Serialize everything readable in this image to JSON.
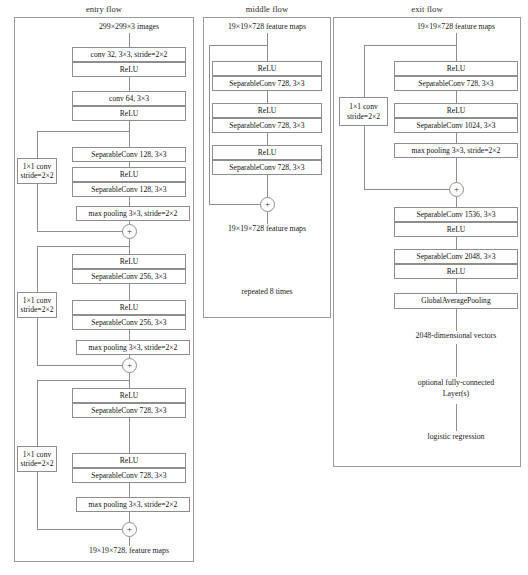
{
  "diagram": {
    "flows": [
      {
        "id": "entry",
        "title": "entry flow",
        "input_label": "299×299×3 images",
        "output_label": "19×19×728, feature maps",
        "boxes": [
          {
            "label": "conv 32, 3×3, stride=2×2"
          },
          {
            "label": "ReLU"
          },
          {
            "label": "conv 64, 3×3"
          },
          {
            "label": "ReLU"
          },
          {
            "label": "SeparableConv 128, 3×3"
          },
          {
            "label": "ReLU"
          },
          {
            "label": "SeparableConv 128, 3×3"
          },
          {
            "label": "max pooling 3×3, stride=2×2"
          },
          {
            "label": "ReLU"
          },
          {
            "label": "SeparableConv 256, 3×3"
          },
          {
            "label": "ReLU"
          },
          {
            "label": "SeparableConv 256, 3×3"
          },
          {
            "label": "max pooling 3×3, stride=2×2"
          },
          {
            "label": "ReLU"
          },
          {
            "label": "SeparableConv 728, 3×3"
          },
          {
            "label": "ReLU"
          },
          {
            "label": "SeparableConv 728, 3×3"
          },
          {
            "label": "max pooling 3×3, stride=2×2"
          }
        ],
        "shortcuts": [
          {
            "line1": "1×1 conv",
            "line2": "stride=2×2"
          },
          {
            "line1": "1×1 conv",
            "line2": "stride=2×2"
          },
          {
            "line1": "1×1 conv",
            "line2": "stride=2×2"
          }
        ],
        "merge_symbol": "+"
      },
      {
        "id": "middle",
        "title": "middle flow",
        "input_label": "19×19×728 feature maps",
        "output_label": "19×19×728 feature maps",
        "repeat_label": "repeated 8 times",
        "boxes": [
          {
            "label": "ReLU"
          },
          {
            "label": "SeparableConv 728, 3×3"
          },
          {
            "label": "ReLU"
          },
          {
            "label": "SeparableConv 728, 3×3"
          },
          {
            "label": "ReLU"
          },
          {
            "label": "SeparableConv 728, 3×3"
          }
        ],
        "merge_symbol": "+"
      },
      {
        "id": "exit",
        "title": "exit flow",
        "input_label": "19×19×728 feature maps",
        "vector_label": "2048-dimensional vectors",
        "optional_label_line1": "optional fully-connected",
        "optional_label_line2": "Layer(s)",
        "final_label": "logistic regression",
        "boxes": [
          {
            "label": "ReLU"
          },
          {
            "label": "SeparableConv 728, 3×3"
          },
          {
            "label": "ReLU"
          },
          {
            "label": "SeparableConv 1024, 3×3"
          },
          {
            "label": "max pooling 3×3, stride=2×2"
          },
          {
            "label": "SeparableConv 1536, 3×3"
          },
          {
            "label": "ReLU"
          },
          {
            "label": "SeparableConv 2048, 3×3"
          },
          {
            "label": "ReLU"
          },
          {
            "label": "GlobalAveragePooling"
          }
        ],
        "shortcuts": [
          {
            "line1": "1×1 conv",
            "line2": "stride=2×2"
          }
        ],
        "merge_symbol": "+"
      }
    ],
    "colors": {
      "stroke": "#8e8e8e",
      "panel_stroke": "#9a9a9a",
      "text": "#1a1a1a",
      "background": "#ffffff"
    }
  }
}
